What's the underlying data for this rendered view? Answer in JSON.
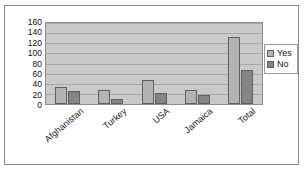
{
  "chart_data": {
    "type": "bar",
    "title": "",
    "xlabel": "",
    "ylabel": "",
    "categories": [
      "Afghanistan",
      "Turkey",
      "USA",
      "Jamaica",
      "Total"
    ],
    "series": [
      {
        "name": "Yes",
        "values": [
          34,
          27,
          48,
          27,
          133
        ],
        "color": "#b3b3b3"
      },
      {
        "name": "No",
        "values": [
          25,
          10,
          22,
          17,
          68
        ],
        "color": "#858585"
      }
    ],
    "ylim": [
      0,
      160
    ],
    "ytick_step": 20,
    "yticks": [
      160,
      140,
      120,
      100,
      80,
      60,
      40,
      20,
      0
    ],
    "ytick_labels": [
      "160",
      "140",
      "120",
      "100",
      "80",
      "60",
      "40",
      "20",
      "0"
    ],
    "grid": true,
    "grid_axis": "y",
    "legend_position": "right",
    "legend_entries": [
      "Yes",
      "No"
    ],
    "plot_background": "#c9c9c9",
    "frame_color": "#8a8a8a"
  },
  "legend": {
    "items": [
      {
        "label": "Yes",
        "swatch": "yes"
      },
      {
        "label": "No",
        "swatch": "no"
      }
    ]
  },
  "title_stub": ""
}
